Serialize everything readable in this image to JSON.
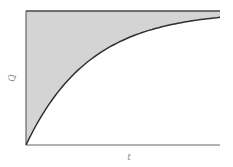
{
  "chart_data": {
    "type": "area",
    "title": "",
    "xlabel": "t",
    "ylabel": "Q",
    "grid": false,
    "legend": null,
    "xlim": [
      0,
      1
    ],
    "ylim": [
      0,
      1
    ],
    "asymptote": 1.0,
    "x": [
      0,
      0.1,
      0.2,
      0.3,
      0.4,
      0.5,
      0.6,
      0.7,
      0.8,
      0.9,
      1.0
    ],
    "series": [
      {
        "name": "Q(t)",
        "values": [
          0,
          0.26,
          0.45,
          0.59,
          0.7,
          0.78,
          0.83,
          0.88,
          0.91,
          0.93,
          0.95
        ]
      },
      {
        "name": "Qmax",
        "values": [
          1,
          1,
          1,
          1,
          1,
          1,
          1,
          1,
          1,
          1,
          1
        ]
      }
    ],
    "colors": {
      "fill": "#d4d4d4",
      "line": "#2f2f2f",
      "axis": "#555555",
      "label": "#8a8a8a"
    }
  },
  "axes": {
    "x_label": "t",
    "y_label": "Q"
  }
}
